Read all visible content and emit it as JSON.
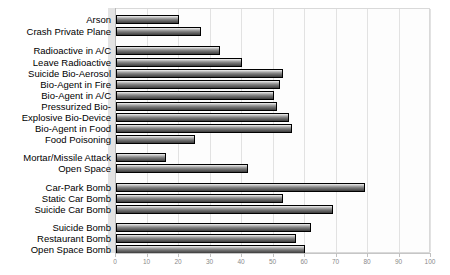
{
  "chart_data": {
    "type": "bar",
    "orientation": "horizontal",
    "title": "",
    "subtitle": "",
    "xlabel": "",
    "ylabel": "",
    "xlim": [
      0,
      100
    ],
    "xticks": [
      0,
      10,
      20,
      30,
      40,
      50,
      60,
      70,
      80,
      90,
      100
    ],
    "xtick_labels": [
      "0",
      "10",
      "20",
      "30",
      "40",
      "50",
      "60",
      "70",
      "80",
      "90",
      "100"
    ],
    "grid": true,
    "legend": null,
    "legend_position": "none",
    "bar_color": "#6f6f6f",
    "bar_edge_color": "#000000",
    "plot_background": "#fdfdfd",
    "categories": [
      "Arson",
      "Crash Private Plane",
      "Radioactive in A/C",
      "Leave Radioactive",
      "Suicide Bio-Aerosol",
      "Bio-Agent in Fire",
      "Bio-Agent in A/C",
      "Pressurized Bio-",
      "Explosive Bio-Device",
      "Bio-Agent in Food",
      "Food Poisoning",
      "Mortar/Missile Attack",
      "Open Space",
      "Car-Park Bomb",
      "Static Car Bomb",
      "Suicide Car Bomb",
      "Suicide Bomb",
      "Restaurant Bomb",
      "Open Space Bomb"
    ],
    "values": [
      20,
      27,
      33,
      40,
      53,
      52,
      50,
      51,
      55,
      56,
      25,
      16,
      42,
      79,
      53,
      69,
      62,
      57,
      60
    ],
    "groups": [
      {
        "name": "group-1",
        "categories": [
          "Arson",
          "Crash Private Plane"
        ]
      },
      {
        "name": "group-2",
        "categories": [
          "Radioactive in A/C",
          "Leave Radioactive",
          "Suicide Bio-Aerosol",
          "Bio-Agent in Fire",
          "Bio-Agent in A/C",
          "Pressurized Bio-",
          "Explosive Bio-Device",
          "Bio-Agent in Food",
          "Food Poisoning"
        ]
      },
      {
        "name": "group-3",
        "categories": [
          "Mortar/Missile Attack",
          "Open Space"
        ]
      },
      {
        "name": "group-4",
        "categories": [
          "Car-Park Bomb",
          "Static Car Bomb",
          "Suicide Car Bomb"
        ]
      },
      {
        "name": "group-5",
        "categories": [
          "Suicide Bomb",
          "Restaurant Bomb",
          "Open Space Bomb"
        ]
      }
    ]
  },
  "rows": [
    {
      "label": "Arson",
      "value": 20,
      "top": 14
    },
    {
      "label": "Crash Private Plane",
      "value": 27,
      "top": 26
    },
    {
      "label": "Radioactive in A/C",
      "value": 33,
      "top": 45
    },
    {
      "label": "Leave Radioactive",
      "value": 40,
      "top": 57
    },
    {
      "label": "Suicide Bio-Aerosol",
      "value": 53,
      "top": 68
    },
    {
      "label": "Bio-Agent in Fire",
      "value": 52,
      "top": 79
    },
    {
      "label": "Bio-Agent in A/C",
      "value": 50,
      "top": 90
    },
    {
      "label": "Pressurized Bio-",
      "value": 51,
      "top": 101
    },
    {
      "label": "Explosive Bio-Device",
      "value": 55,
      "top": 112
    },
    {
      "label": "Bio-Agent in Food",
      "value": 56,
      "top": 123
    },
    {
      "label": "Food Poisoning",
      "value": 25,
      "top": 134
    },
    {
      "label": "Mortar/Missile Attack",
      "value": 16,
      "top": 152
    },
    {
      "label": "Open Space",
      "value": 42,
      "top": 163
    },
    {
      "label": "Car-Park Bomb",
      "value": 79,
      "top": 182
    },
    {
      "label": "Static Car Bomb",
      "value": 53,
      "top": 193
    },
    {
      "label": "Suicide Car Bomb",
      "value": 69,
      "top": 204
    },
    {
      "label": "Suicide Bomb",
      "value": 62,
      "top": 222
    },
    {
      "label": "Restaurant Bomb",
      "value": 57,
      "top": 233
    },
    {
      "label": "Open Space Bomb",
      "value": 60,
      "top": 244
    }
  ],
  "ticks": [
    {
      "label": "0",
      "value": 0
    },
    {
      "label": "10",
      "value": 10
    },
    {
      "label": "20",
      "value": 20
    },
    {
      "label": "30",
      "value": 30
    },
    {
      "label": "40",
      "value": 40
    },
    {
      "label": "50",
      "value": 50
    },
    {
      "label": "60",
      "value": 60
    },
    {
      "label": "70",
      "value": 70
    },
    {
      "label": "80",
      "value": 80
    },
    {
      "label": "90",
      "value": 90
    },
    {
      "label": "100",
      "value": 100
    }
  ]
}
